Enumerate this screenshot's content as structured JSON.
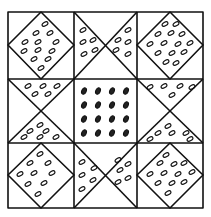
{
  "diagram": {
    "type": "quilt-block",
    "grid": {
      "rows": 3,
      "cols": 3
    },
    "colors": {
      "line": "#111111",
      "background": "#ffffff"
    },
    "cells": [
      {
        "pos": "top-left",
        "pattern": "diamond-seeded"
      },
      {
        "pos": "top-center",
        "pattern": "hourglass-left-right-seeded"
      },
      {
        "pos": "top-right",
        "pattern": "diamond-seeded"
      },
      {
        "pos": "middle-left",
        "pattern": "hourglass-top-bottom-seeded"
      },
      {
        "pos": "center",
        "pattern": "square-dark-seeds-4x4"
      },
      {
        "pos": "middle-right",
        "pattern": "hourglass-top-bottom-seeded"
      },
      {
        "pos": "bottom-left",
        "pattern": "diamond-seeded"
      },
      {
        "pos": "bottom-center",
        "pattern": "hourglass-left-right-seeded"
      },
      {
        "pos": "bottom-right",
        "pattern": "diamond-seeded"
      }
    ]
  }
}
